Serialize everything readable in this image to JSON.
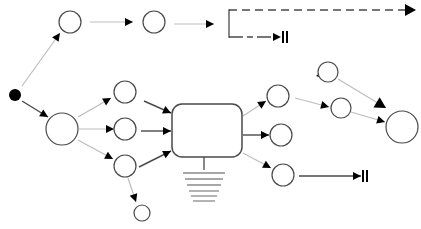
{
  "diagram": {
    "type": "activity-flow",
    "colors": {
      "stroke_dark": "#4a4a4a",
      "stroke_light": "#bdbdbd",
      "fill_node": "#ffffff",
      "fill_start": "#000000",
      "arrowhead": "#000000"
    },
    "nodes": [
      {
        "id": "start",
        "kind": "initial",
        "cx": 15,
        "cy": 95,
        "r": 6
      },
      {
        "id": "n-top-1",
        "kind": "state",
        "cx": 70,
        "cy": 22,
        "r": 11
      },
      {
        "id": "n-top-2",
        "kind": "state",
        "cx": 154,
        "cy": 22,
        "r": 11
      },
      {
        "id": "n-hub-left",
        "kind": "state",
        "cx": 62,
        "cy": 129,
        "r": 16
      },
      {
        "id": "n-mid-a",
        "kind": "state",
        "cx": 125,
        "cy": 92,
        "r": 11
      },
      {
        "id": "n-mid-b",
        "kind": "state",
        "cx": 125,
        "cy": 129,
        "r": 11
      },
      {
        "id": "n-mid-c",
        "kind": "state",
        "cx": 125,
        "cy": 166,
        "r": 11
      },
      {
        "id": "n-small-bottom",
        "kind": "state",
        "cx": 142,
        "cy": 213,
        "r": 8
      },
      {
        "id": "n-right-a",
        "kind": "state",
        "cx": 278,
        "cy": 96,
        "r": 11
      },
      {
        "id": "n-right-b",
        "kind": "state",
        "cx": 281,
        "cy": 135,
        "r": 11
      },
      {
        "id": "n-right-c",
        "kind": "state",
        "cx": 283,
        "cy": 175,
        "r": 11
      },
      {
        "id": "n-far-top",
        "kind": "state",
        "cx": 328,
        "cy": 72,
        "r": 10
      },
      {
        "id": "n-far-mid",
        "kind": "state",
        "cx": 341,
        "cy": 108,
        "r": 10
      },
      {
        "id": "n-hub-right",
        "kind": "state",
        "cx": 402,
        "cy": 127,
        "r": 16
      }
    ],
    "process_box": {
      "id": "central-process",
      "x": 172,
      "y": 104,
      "width": 70,
      "height": 53,
      "rx": 10
    },
    "ground": {
      "stem": {
        "x": 204,
        "y1": 157,
        "y2": 170
      },
      "lines": [
        {
          "y": 173,
          "width": 42
        },
        {
          "y": 179,
          "width": 38
        },
        {
          "y": 185,
          "width": 34
        },
        {
          "y": 191,
          "width": 30
        },
        {
          "y": 196,
          "width": 26
        },
        {
          "y": 201,
          "width": 22
        }
      ]
    },
    "edges": [
      {
        "id": "e-start-top1",
        "x1": 22,
        "y1": 86,
        "x2": 60,
        "y2": 33,
        "style": "light",
        "head": "small"
      },
      {
        "id": "e-start-hub",
        "x1": 22,
        "y1": 101,
        "x2": 48,
        "y2": 117,
        "style": "dark",
        "head": "small"
      },
      {
        "id": "e-top1-top2",
        "x1": 90,
        "y1": 22,
        "x2": 133,
        "y2": 22,
        "style": "light",
        "head": "small"
      },
      {
        "id": "e-top2-bracket",
        "x1": 174,
        "y1": 24,
        "x2": 214,
        "y2": 24,
        "style": "light",
        "head": "small"
      },
      {
        "id": "e-hub-mida",
        "x1": 78,
        "y1": 117,
        "x2": 111,
        "y2": 98,
        "style": "light",
        "head": "small"
      },
      {
        "id": "e-hub-midb",
        "x1": 79,
        "y1": 129,
        "x2": 114,
        "y2": 129,
        "style": "light",
        "head": "small"
      },
      {
        "id": "e-hub-midc",
        "x1": 78,
        "y1": 140,
        "x2": 113,
        "y2": 159,
        "style": "light",
        "head": "small"
      },
      {
        "id": "e-mida-box",
        "x1": 144,
        "y1": 101,
        "x2": 171,
        "y2": 113,
        "style": "dark",
        "head": "small"
      },
      {
        "id": "e-midb-box",
        "x1": 141,
        "y1": 131,
        "x2": 171,
        "y2": 131,
        "style": "dark",
        "head": "small"
      },
      {
        "id": "e-midc-box",
        "x1": 139,
        "y1": 167,
        "x2": 171,
        "y2": 151,
        "style": "dark",
        "head": "small"
      },
      {
        "id": "e-midc-small",
        "x1": 128,
        "y1": 178,
        "x2": 136,
        "y2": 202,
        "style": "light",
        "head": "small"
      },
      {
        "id": "e-box-righta",
        "x1": 243,
        "y1": 116,
        "x2": 266,
        "y2": 101,
        "style": "light",
        "head": "small"
      },
      {
        "id": "e-box-rightb",
        "x1": 243,
        "y1": 135,
        "x2": 269,
        "y2": 135,
        "style": "dark",
        "head": "small"
      },
      {
        "id": "e-box-rightc",
        "x1": 243,
        "y1": 153,
        "x2": 271,
        "y2": 168,
        "style": "light",
        "head": "small"
      },
      {
        "id": "e-righta-farmid",
        "x1": 295,
        "y1": 98,
        "x2": 329,
        "y2": 107,
        "style": "light",
        "head": "small"
      },
      {
        "id": "e-fartop-self",
        "x1": 318,
        "y1": 78,
        "x2": 316,
        "y2": 76,
        "style": "light",
        "head": "small"
      },
      {
        "id": "e-fartop-hub",
        "x1": 338,
        "y1": 79,
        "x2": 386,
        "y2": 108,
        "style": "light",
        "head": "large"
      },
      {
        "id": "e-farmid-hub",
        "x1": 351,
        "y1": 112,
        "x2": 385,
        "y2": 122,
        "style": "light",
        "head": "small"
      },
      {
        "id": "e-rightc-end",
        "x1": 299,
        "y1": 176,
        "x2": 361,
        "y2": 176,
        "style": "dark",
        "head": "small",
        "terminator": "flow-final"
      }
    ],
    "bracket": {
      "x": 229,
      "top_y": 10,
      "bottom_y": 37,
      "top_branch": {
        "x2": 416,
        "style": "dashed",
        "head": "large"
      },
      "bottom_branch": {
        "x2": 281,
        "style": "dashed",
        "head": "small",
        "terminator": "flow-final"
      }
    }
  }
}
